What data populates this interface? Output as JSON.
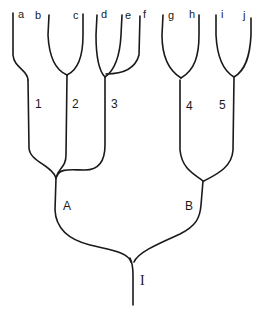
{
  "diagram": {
    "type": "tree",
    "root": {
      "label": "I"
    },
    "level1": [
      {
        "label": "A"
      },
      {
        "label": "B"
      }
    ],
    "level2": [
      {
        "label": "1",
        "parent": "A"
      },
      {
        "label": "2",
        "parent": "A"
      },
      {
        "label": "3",
        "parent": "A"
      },
      {
        "label": "4",
        "parent": "B"
      },
      {
        "label": "5",
        "parent": "B"
      }
    ],
    "leaves": [
      {
        "label": "a",
        "parent": "1"
      },
      {
        "label": "b",
        "parent": "2"
      },
      {
        "label": "c",
        "parent": "2"
      },
      {
        "label": "d",
        "parent": "3"
      },
      {
        "label": "e",
        "parent": "3"
      },
      {
        "label": "f",
        "parent": "3"
      },
      {
        "label": "g",
        "parent": "4"
      },
      {
        "label": "h",
        "parent": "4"
      },
      {
        "label": "i",
        "parent": "5"
      },
      {
        "label": "j",
        "parent": "5"
      }
    ]
  }
}
